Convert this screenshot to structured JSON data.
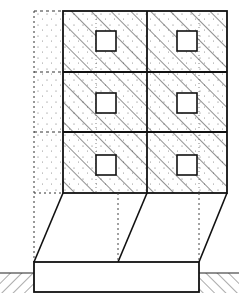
{
  "diagram": {
    "type": "architectural-elevation",
    "colors": {
      "stroke": "#111111",
      "background": "#ffffff",
      "hatch": "#333333",
      "stipple": "#555555"
    },
    "grid": {
      "x": 63,
      "y": 11,
      "width": 164,
      "height": 182,
      "columns": 2,
      "rows": 3,
      "column_divider_x": 147,
      "row_dividers_y": [
        72,
        132
      ]
    },
    "windows": [
      {
        "x": 96,
        "y": 31,
        "size": 20
      },
      {
        "x": 177,
        "y": 31,
        "size": 20
      },
      {
        "x": 96,
        "y": 93,
        "size": 20
      },
      {
        "x": 177,
        "y": 93,
        "size": 20
      },
      {
        "x": 96,
        "y": 155,
        "size": 20
      },
      {
        "x": 177,
        "y": 155,
        "size": 20
      }
    ],
    "dashed_column": {
      "x1": 34,
      "x2": 63,
      "y_top": 11,
      "y_bottom": 262
    },
    "transition": {
      "top_y": 193,
      "bottom_y": 262,
      "slant_lines": [
        {
          "x1": 63,
          "y1": 193,
          "x2": 34,
          "y2": 262
        },
        {
          "x1": 147,
          "y1": 193,
          "x2": 118,
          "y2": 262
        },
        {
          "x1": 227,
          "y1": 193,
          "x2": 199,
          "y2": 262
        }
      ],
      "dotted_verticals_x": [
        118,
        199
      ]
    },
    "footing": {
      "x": 34,
      "y": 262,
      "width": 165,
      "height": 30
    },
    "ground": {
      "left": {
        "x": 0,
        "y": 273,
        "width": 34
      },
      "right": {
        "x": 199,
        "y": 273,
        "width": 40
      }
    }
  }
}
